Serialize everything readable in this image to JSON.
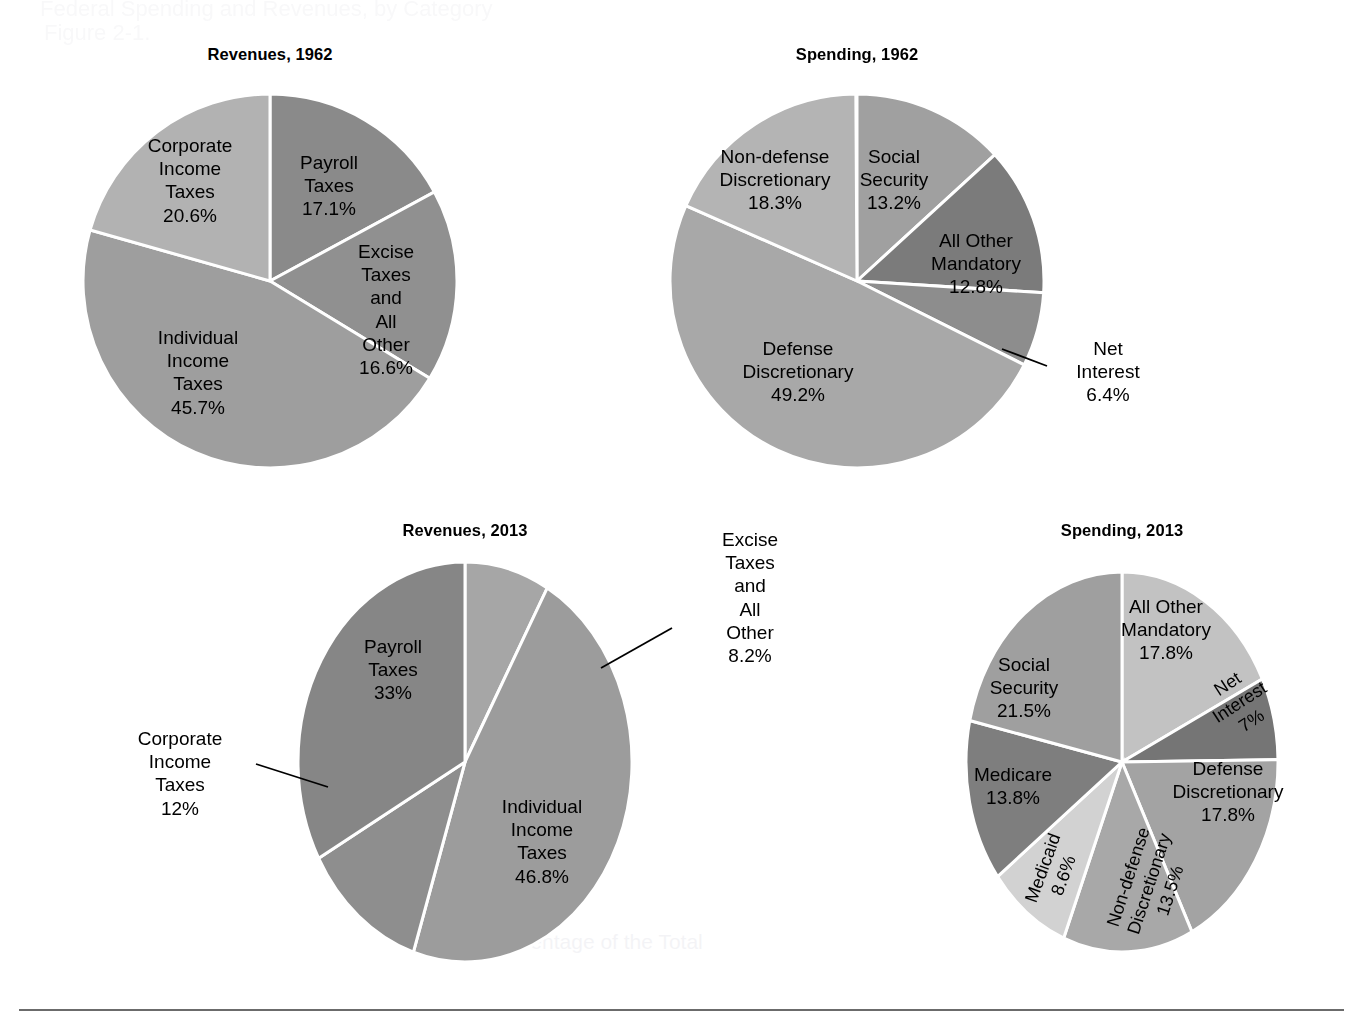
{
  "figure": {
    "background_color": "#ffffff",
    "label_text_color": "#000000",
    "separator_color": "#ffffff",
    "footer_rule_color": "#6b6b6b",
    "ghost_top_line1": "Federal Spending and Revenues, by Category",
    "ghost_top_line2": "Figure 2-1.",
    "ghost_footer": "Percentage of the Total"
  },
  "chart_data": [
    {
      "id": "revenues-1962",
      "type": "pie",
      "title": "Revenues, 1962",
      "center": {
        "x": 270,
        "y": 281
      },
      "radius": {
        "x": 187,
        "y": 187
      },
      "start_angle_deg": 0,
      "direction": "clockwise",
      "total": 100,
      "slices": [
        {
          "label": "Payroll\nTaxes",
          "value": 17.1,
          "value_label": "17.1%",
          "color": "#8a8a8a",
          "label_pos": {
            "x": 329,
            "y": 186
          },
          "label_style": "inside"
        },
        {
          "label": "Excise\nTaxes and\nAll Other",
          "value": 16.6,
          "value_label": "16.6%",
          "color": "#909090",
          "label_pos": {
            "x": 384,
            "y": 310
          },
          "label_style": "inside"
        },
        {
          "label": "Individual\nIncome Taxes",
          "value": 45.7,
          "value_label": "45.7%",
          "color": "#9e9e9e",
          "label_pos": {
            "x": 197,
            "y": 372
          },
          "label_style": "inside"
        },
        {
          "label": "Corporate\nIncome Taxes",
          "value": 20.6,
          "value_label": "20.6%",
          "color": "#b2b2b2",
          "label_pos": {
            "x": 190,
            "y": 180
          },
          "label_style": "inside"
        }
      ]
    },
    {
      "id": "spending-1962",
      "type": "pie",
      "title": "Spending, 1962",
      "center": {
        "x": 857,
        "y": 281
      },
      "radius": {
        "x": 187,
        "y": 187
      },
      "start_angle_deg": 0,
      "direction": "clockwise",
      "total": 100,
      "slices": [
        {
          "label": "Social\nSecurity",
          "value": 13.2,
          "value_label": "13.2%",
          "color": "#a0a0a0",
          "label_pos": {
            "x": 894,
            "y": 180
          },
          "label_style": "inside"
        },
        {
          "label": "All Other\nMandatory",
          "value": 12.8,
          "value_label": "12.8%",
          "color": "#7b7b7b",
          "label_pos": {
            "x": 973,
            "y": 264
          },
          "label_style": "inside"
        },
        {
          "label": "Net Interest",
          "value": 6.4,
          "value_label": "6.4%",
          "color": "#8d8d8d",
          "label_pos": {
            "x": 1102,
            "y": 372
          },
          "label_style": "leader"
        },
        {
          "label": "Defense\nDiscretionary",
          "value": 49.2,
          "value_label": "49.2%",
          "color": "#a8a8a8",
          "label_pos": {
            "x": 798,
            "y": 372
          },
          "label_style": "inside"
        },
        {
          "label": "Non-defense\nDiscretionary",
          "value": 18.3,
          "value_label": "18.3%",
          "color": "#b4b4b4",
          "label_pos": {
            "x": 775,
            "y": 180
          },
          "label_style": "inside"
        }
      ]
    },
    {
      "id": "revenues-2013",
      "type": "pie",
      "title": "Revenues, 2013",
      "center": {
        "x": 465,
        "y": 762
      },
      "radius": {
        "x": 167,
        "y": 200
      },
      "start_angle_deg": 0,
      "direction": "clockwise",
      "total": 100,
      "slices": [
        {
          "label": "Excise Taxes\nand All Other",
          "value": 8.2,
          "value_label": "8.2%",
          "color": "#a6a6a6",
          "label_pos": {
            "x": 748,
            "y": 601
          },
          "label_style": "leader"
        },
        {
          "label": "Individual Income Taxes",
          "value": 46.8,
          "value_label": "46.8%",
          "color": "#9c9c9c",
          "label_pos": {
            "x": 540,
            "y": 843
          },
          "label_style": "inside"
        },
        {
          "label": "Corporate\nIncome Taxes",
          "value": 12,
          "value_label": "12%",
          "color": "#8e8e8e",
          "label_pos": {
            "x": 180,
            "y": 773
          },
          "label_style": "leader"
        },
        {
          "label": "Payroll\nTaxes",
          "value": 33,
          "value_label": "33%",
          "color": "#868686",
          "label_pos": {
            "x": 392,
            "y": 671
          },
          "label_style": "inside"
        }
      ]
    },
    {
      "id": "spending-2013",
      "type": "pie",
      "title": "Spending, 2013",
      "center": {
        "x": 1122,
        "y": 762
      },
      "radius": {
        "x": 156,
        "y": 190
      },
      "start_angle_deg": 0,
      "direction": "clockwise",
      "total": 100,
      "slices": [
        {
          "label": "All Other\nMandatory",
          "value": 17.8,
          "value_label": "17.8%",
          "color": "#c2c2c2",
          "label_pos": {
            "x": 1164,
            "y": 631
          },
          "label_style": "inside"
        },
        {
          "label": "Net Interest",
          "value": 7,
          "value_label": "7%",
          "color": "#757575",
          "label_pos": {
            "x": 1240,
            "y": 701
          },
          "label_style": "rotated"
        },
        {
          "label": "Defense\nDiscretionary",
          "value": 17.8,
          "value_label": "17.8%",
          "color": "#a3a3a3",
          "label_pos": {
            "x": 1227,
            "y": 793
          },
          "label_style": "inside"
        },
        {
          "label": "Non-defense\nDiscretionary",
          "value": 13.5,
          "value_label": "13.5%",
          "color": "#a8a8a8",
          "label_pos": {
            "x": 1148,
            "y": 884
          },
          "label_style": "rotated-vertical"
        },
        {
          "label": "Medicaid",
          "value": 8.6,
          "value_label": "8.6%",
          "color": "#d2d2d2",
          "label_pos": {
            "x": 1053,
            "y": 872
          },
          "label_style": "rotated-vertical"
        },
        {
          "label": "Medicare",
          "value": 13.8,
          "value_label": "13.8%",
          "color": "#7e7e7e",
          "label_pos": {
            "x": 1012,
            "y": 786
          },
          "label_style": "inside"
        },
        {
          "label": "Social Security",
          "value": 21.5,
          "value_label": "21.5%",
          "color": "#9f9f9f",
          "label_pos": {
            "x": 1023,
            "y": 689
          },
          "label_style": "inside"
        }
      ]
    }
  ]
}
